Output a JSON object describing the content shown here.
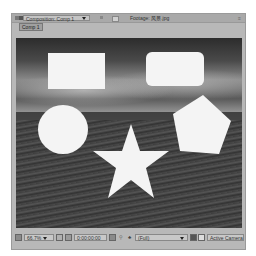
{
  "tabs": {
    "composition": {
      "label": "Composition: Comp 1",
      "active": true
    },
    "footage": {
      "label": "Footage: 风景.jpg"
    }
  },
  "subtab": {
    "label": "Comp 1"
  },
  "viewer": {
    "background": "grayscale landscape photo: cloudy sky over grassy field",
    "shapes": [
      {
        "type": "rectangle",
        "color": "#f4f4f4"
      },
      {
        "type": "rounded-rectangle",
        "color": "#f4f4f4"
      },
      {
        "type": "circle",
        "color": "#f4f4f4"
      },
      {
        "type": "star",
        "color": "#f4f4f4"
      },
      {
        "type": "pentagon",
        "color": "#f4f4f4"
      }
    ]
  },
  "bottom_bar": {
    "zoom": "66.7%",
    "timecode": "0:00:00:00",
    "resolution": "(Full)",
    "view": "Active Camera"
  },
  "icons": {
    "lock": "lock-icon",
    "comp": "composition-icon",
    "snapshot": "camera-icon",
    "channel": "color-channel-icon",
    "region": "region-of-interest-icon",
    "grid": "grid-icon"
  }
}
